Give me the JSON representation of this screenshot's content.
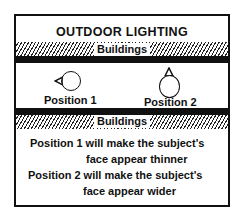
{
  "diagram": {
    "title": "OUTDOOR LIGHTING",
    "top_label": "Buildings",
    "bottom_label": "Buildings",
    "positions": [
      {
        "label": "Position 1",
        "pointer": "left"
      },
      {
        "label": "Position 2",
        "pointer": "up"
      }
    ],
    "notes": [
      "Position 1 will make the subject's",
      "face appear thinner",
      "Position 2 will make the subject's",
      "face appear wider"
    ]
  }
}
